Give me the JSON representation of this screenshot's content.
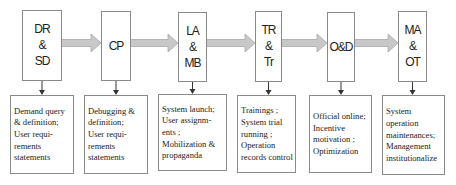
{
  "diagram": {
    "colors": {
      "box_border": "#8a8a8a",
      "arrow_fill": "#c8c8c8",
      "arrow_stroke": "#a8a8a8",
      "connector": "#333333",
      "text": "#222222"
    },
    "stages": [
      {
        "label_lines": [
          "DR",
          "&",
          "SD"
        ],
        "description_lines": [
          "Demand query",
          "& definition;",
          "User requi-",
          "rements",
          "statements"
        ]
      },
      {
        "label_lines": [
          "CP"
        ],
        "description_lines": [
          "Debugging &",
          "definition;",
          "User requi-",
          "rements",
          "statements"
        ]
      },
      {
        "label_lines": [
          "LA",
          "&",
          "MB"
        ],
        "description_lines": [
          "System launch;",
          "User assignm-",
          "ents ;",
          "Mobilization &",
          "propaganda"
        ]
      },
      {
        "label_lines": [
          "TR",
          "&",
          "Tr"
        ],
        "description_lines": [
          "Trainings ;",
          "System trial",
          "running ;",
          "Operation",
          "records control"
        ]
      },
      {
        "label_lines": [
          "O&D"
        ],
        "description_lines": [
          "Official online;",
          "Incentive",
          "motivation  ;",
          "Optimization"
        ]
      },
      {
        "label_lines": [
          "MA",
          "&",
          "OT"
        ],
        "description_lines": [
          "System",
          "operation",
          "maintenances;",
          "Management",
          "institutionalize"
        ]
      }
    ]
  }
}
